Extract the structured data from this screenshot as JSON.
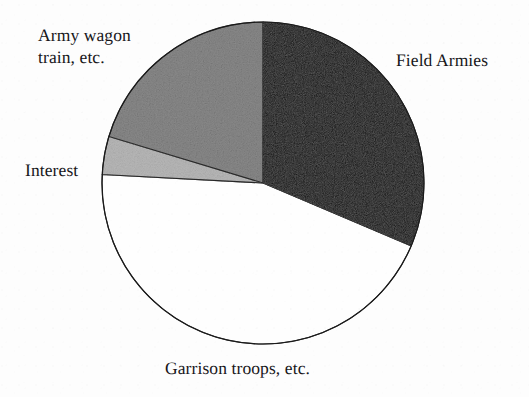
{
  "figure": {
    "background_color": "#fdfdfd",
    "outline_color": "#1a1a1a",
    "center_x": 263,
    "center_y": 183,
    "radius": 161
  },
  "labels": {
    "field_armies": "Field Armies",
    "army_wagon": "Army wagon\ntrain, etc.",
    "interest": "Interest",
    "garrison": "Garrison troops, etc."
  },
  "chart_data": {
    "type": "pie",
    "title": "",
    "xlabel": "",
    "ylabel": "",
    "legend_position": "none",
    "grid": false,
    "labels_placement": "outside-callout",
    "start_angle_deg": 0,
    "direction": "clockwise",
    "categories": [
      "Field Armies",
      "Garrison troops, etc.",
      "Interest",
      "Army wagon train, etc."
    ],
    "values": [
      31.4,
      44.4,
      3.8,
      20.4
    ],
    "units": "percent",
    "colors": [
      "#100f10",
      "#fefefe",
      "#b8b8b8",
      "#8a8a8a"
    ],
    "slices": [
      {
        "label": "Field Armies",
        "value": 31.4,
        "fill": "#100f10",
        "fill_name": "black",
        "start_angle_deg": 0,
        "end_angle_deg": 113
      },
      {
        "label": "Garrison troops, etc.",
        "value": 44.4,
        "fill": "#fefefe",
        "fill_name": "white",
        "start_angle_deg": 113,
        "end_angle_deg": 273
      },
      {
        "label": "Interest",
        "value": 3.8,
        "fill": "#b8b8b8",
        "fill_name": "light-gray",
        "start_angle_deg": 273,
        "end_angle_deg": 286.8
      },
      {
        "label": "Army wagon train, etc.",
        "value": 20.4,
        "fill": "#8a8a8a",
        "fill_name": "dark-gray",
        "start_angle_deg": 286.8,
        "end_angle_deg": 360
      }
    ]
  }
}
